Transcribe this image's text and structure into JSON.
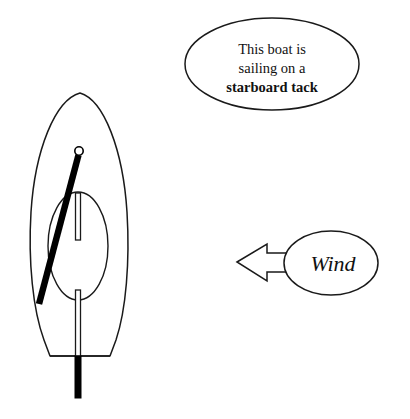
{
  "page": {
    "background_color": "#ffffff",
    "width": 410,
    "height": 419
  },
  "callout": {
    "name": "tack-callout",
    "shape": "ellipse",
    "line1": "This boat is",
    "line2": "sailing on a",
    "line3": "starboard tack",
    "line3_bold": true,
    "stroke_color": "#1a1a1a",
    "fill_color": "#ffffff"
  },
  "wind": {
    "name": "wind-callout",
    "shape": "ellipse-with-left-arrow",
    "label": "Wind",
    "italic": true,
    "direction": "left",
    "stroke_color": "#1a1a1a",
    "fill_color": "#ffffff"
  },
  "boat": {
    "name": "sailboat-top-view",
    "heading": "bow-up",
    "parts": [
      {
        "id": "hull",
        "label": "hull",
        "fill": "#ffffff",
        "stroke": "#1a1a1a"
      },
      {
        "id": "cockpit",
        "label": "cockpit",
        "fill": "#ffffff",
        "stroke": "#1a1a1a"
      },
      {
        "id": "boom",
        "label": "boom",
        "color": "#000000"
      },
      {
        "id": "mast",
        "label": "mast",
        "color": "#000000"
      },
      {
        "id": "centerboard",
        "label": "centerboard",
        "fill": "#ffffff",
        "stroke": "#1a1a1a"
      },
      {
        "id": "tiller",
        "label": "tiller",
        "fill": "#ffffff",
        "stroke": "#1a1a1a"
      },
      {
        "id": "rudder",
        "label": "rudder",
        "color": "#000000"
      },
      {
        "id": "transom",
        "label": "transom",
        "stroke": "#1a1a1a"
      }
    ]
  }
}
